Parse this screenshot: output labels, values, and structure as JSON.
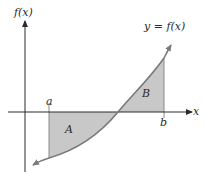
{
  "diagram": {
    "labels": {
      "y_axis": "f(x)",
      "x_axis": "x",
      "curve": "y = f(x)",
      "left_bound": "a",
      "right_bound": "b",
      "region_below": "A",
      "region_above": "B"
    },
    "colors": {
      "axis": "#3a3a3a",
      "curve": "#7a7a7a",
      "shading": "#c8c8c8",
      "background": "#ffffff"
    },
    "geometry": {
      "origin_px": [
        25,
        112
      ],
      "a_px": 49,
      "b_px": 164,
      "zero_crossing_px": 118
    }
  }
}
